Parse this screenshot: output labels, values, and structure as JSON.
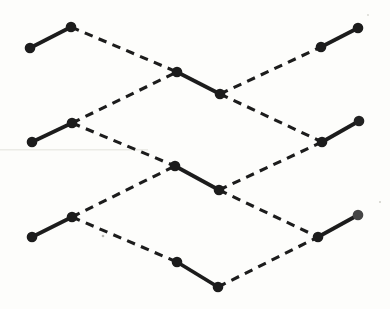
{
  "figure": {
    "width": 390,
    "height": 309,
    "background_color": "#fdfdfb",
    "ink_color": "#1c1c1c",
    "node_radius": 5.3,
    "solid_stroke_width": 3.8,
    "dashed_stroke_width": 3.1,
    "dash_segment": 8.5,
    "dash_gap": 6.5,
    "nodes": [
      {
        "id": "dimer-a-left",
        "x": 30,
        "y": 48
      },
      {
        "id": "dimer-a-right",
        "x": 71,
        "y": 27
      },
      {
        "id": "dimer-b-left",
        "x": 177,
        "y": 72
      },
      {
        "id": "dimer-b-right",
        "x": 220,
        "y": 94
      },
      {
        "id": "dimer-c-left",
        "x": 321,
        "y": 47
      },
      {
        "id": "dimer-c-right",
        "x": 358,
        "y": 28
      },
      {
        "id": "dimer-d-left",
        "x": 32,
        "y": 142
      },
      {
        "id": "dimer-d-right",
        "x": 72,
        "y": 123
      },
      {
        "id": "dimer-e-left",
        "x": 175,
        "y": 166
      },
      {
        "id": "dimer-e-right",
        "x": 219,
        "y": 190
      },
      {
        "id": "dimer-f-left",
        "x": 322,
        "y": 142
      },
      {
        "id": "dimer-f-right",
        "x": 359,
        "y": 121,
        "color": "#232323"
      },
      {
        "id": "dimer-g-left",
        "x": 32,
        "y": 237
      },
      {
        "id": "dimer-g-right",
        "x": 72,
        "y": 217
      },
      {
        "id": "dimer-h-left",
        "x": 177,
        "y": 262
      },
      {
        "id": "dimer-h-right",
        "x": 218,
        "y": 287
      },
      {
        "id": "dimer-i-left",
        "x": 318,
        "y": 237
      },
      {
        "id": "dimer-i-right",
        "x": 358,
        "y": 215,
        "color": "#454545"
      }
    ],
    "solid_bonds": [
      [
        "dimer-a-left",
        "dimer-a-right"
      ],
      [
        "dimer-b-left",
        "dimer-b-right"
      ],
      [
        "dimer-c-left",
        "dimer-c-right"
      ],
      [
        "dimer-d-left",
        "dimer-d-right"
      ],
      [
        "dimer-e-left",
        "dimer-e-right"
      ],
      [
        "dimer-f-left",
        "dimer-f-right"
      ],
      [
        "dimer-g-left",
        "dimer-g-right"
      ],
      [
        "dimer-h-left",
        "dimer-h-right"
      ],
      [
        "dimer-i-left",
        "dimer-i-right"
      ]
    ],
    "dashed_bonds": [
      [
        "dimer-a-right",
        "dimer-b-left"
      ],
      [
        "dimer-d-right",
        "dimer-b-left"
      ],
      [
        "dimer-b-right",
        "dimer-c-left"
      ],
      [
        "dimer-b-right",
        "dimer-f-left"
      ],
      [
        "dimer-d-right",
        "dimer-e-left"
      ],
      [
        "dimer-g-right",
        "dimer-e-left"
      ],
      [
        "dimer-e-right",
        "dimer-f-left"
      ],
      [
        "dimer-e-right",
        "dimer-i-left"
      ],
      [
        "dimer-g-right",
        "dimer-h-left"
      ],
      [
        "dimer-h-right",
        "dimer-i-left"
      ]
    ],
    "scan_artifacts": {
      "streak": {
        "x": 0,
        "y": 149,
        "width": 148,
        "height": 1.5,
        "color": "#ebebe6"
      },
      "specks": [
        {
          "x": 103,
          "y": 236,
          "r": 1.3,
          "color": "#b9b9b4"
        },
        {
          "x": 380,
          "y": 202,
          "r": 1.0,
          "color": "#cfcfc9"
        },
        {
          "x": 368,
          "y": 15,
          "r": 0.9,
          "color": "#d6d6d0"
        }
      ]
    }
  }
}
